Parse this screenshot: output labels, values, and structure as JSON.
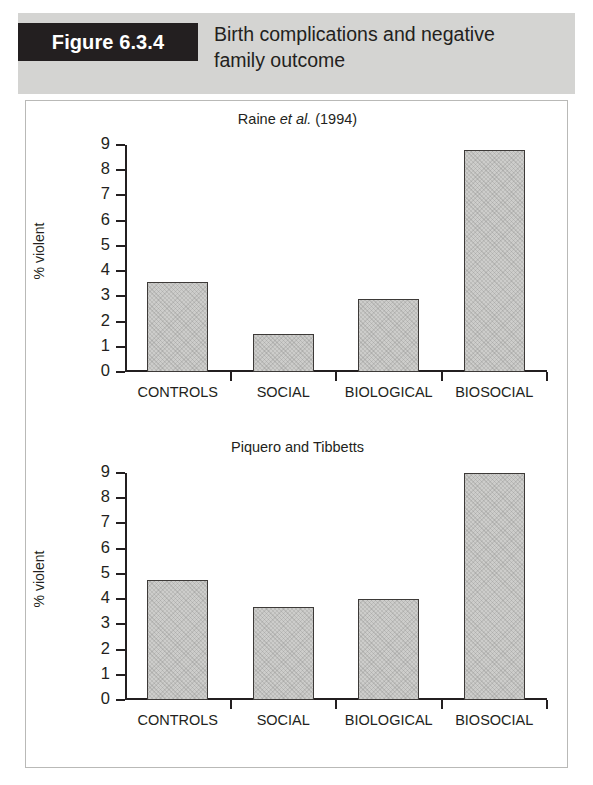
{
  "figure": {
    "tag": "Figure 6.3.4",
    "caption_line1": "Birth complications and negative",
    "caption_line2": "family outcome",
    "tag_bg": "#231f20",
    "band_bg": "#d4d4d2"
  },
  "chart_data": [
    {
      "type": "bar",
      "title_prefix": "Raine ",
      "title_italic": "et al.",
      "title_suffix": " (1994)",
      "title": "Raine et al. (1994)",
      "categories": [
        "CONTROLS",
        "SOCIAL",
        "BIOLOGICAL",
        "BIOSOCIAL"
      ],
      "values": [
        3.55,
        1.5,
        2.9,
        8.8
      ],
      "xlabel": "",
      "ylabel": "% violent",
      "ylim": [
        0,
        9
      ],
      "yticks": [
        0,
        1,
        2,
        3,
        4,
        5,
        6,
        7,
        8,
        9
      ],
      "grid": false,
      "legend": "none",
      "bar_fill": "#cdcdcb",
      "bar_edge": "#3d3a38"
    },
    {
      "type": "bar",
      "title_prefix": "",
      "title_italic": "",
      "title_suffix": "",
      "title": "Piquero and Tibbetts",
      "categories": [
        "CONTROLS",
        "SOCIAL",
        "BIOLOGICAL",
        "BIOSOCIAL"
      ],
      "values": [
        4.75,
        3.7,
        4.0,
        9.0
      ],
      "xlabel": "",
      "ylabel": "% violent",
      "ylim": [
        0,
        9
      ],
      "yticks": [
        0,
        1,
        2,
        3,
        4,
        5,
        6,
        7,
        8,
        9
      ],
      "grid": false,
      "legend": "none",
      "bar_fill": "#cdcdcb",
      "bar_edge": "#3d3a38"
    }
  ]
}
